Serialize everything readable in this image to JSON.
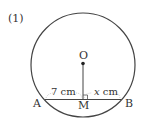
{
  "problem": {
    "number_label": "(1)"
  },
  "figure": {
    "circle": {
      "cx": 83,
      "cy": 65,
      "r": 52,
      "stroke": "#444444"
    },
    "center": {
      "label": "O",
      "x": 83,
      "y": 63.5
    },
    "chord": {
      "start": {
        "label": "A",
        "x": 45,
        "y": 99.5
      },
      "end": {
        "label": "B",
        "x": 121,
        "y": 99.5
      }
    },
    "midpoint": {
      "label": "M",
      "x": 83,
      "y": 99.5
    },
    "measurements": {
      "left_segment": "7 cm",
      "right_segment_var": "x",
      "right_segment_unit": " cm"
    },
    "right_angle_marker": true,
    "line_color": "#444444",
    "text_color": "#333333"
  }
}
